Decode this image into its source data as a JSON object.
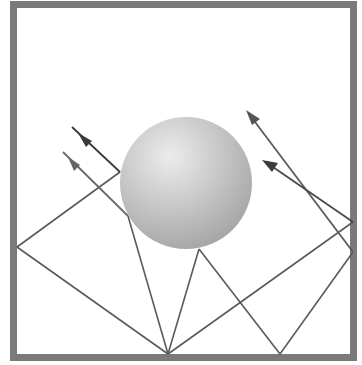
{
  "diagram": {
    "title": "",
    "colors": {
      "frame": "#7a7a7a",
      "ray": "#5a5a5a",
      "arrow_dark": "#3a3a3a",
      "arrow_light": "#6a6a6a",
      "sphere_light": "#ebebeb",
      "sphere_dark": "#a6a6a6",
      "background": "#ffffff"
    },
    "frame": {
      "x": 13.5,
      "y": 4.5,
      "width": 340,
      "height": 353,
      "stroke_width": 7
    },
    "sphere": {
      "cx": 186,
      "cy": 183,
      "r": 66
    },
    "incoming_rays": [
      {
        "name": "incoming-ray-1",
        "from": [
          72,
          127
        ],
        "to": [
          120,
          172
        ]
      },
      {
        "name": "incoming-ray-2",
        "from": [
          63,
          152
        ],
        "to": [
          128,
          216
        ]
      }
    ],
    "reflected_segments": [
      {
        "name": "segment-sphere-to-left-wall",
        "from": [
          120,
          172
        ],
        "to": [
          17,
          247
        ]
      },
      {
        "name": "segment-left-wall-to-bottom",
        "from": [
          17,
          247
        ],
        "to": [
          168,
          354
        ]
      },
      {
        "name": "segment-sphere-to-bottom-1",
        "from": [
          128,
          216
        ],
        "to": [
          168,
          354
        ]
      },
      {
        "name": "segment-bottom-to-sphere",
        "from": [
          168,
          354
        ],
        "to": [
          199,
          249
        ]
      },
      {
        "name": "segment-sphere-to-bottom-2",
        "from": [
          199,
          249
        ],
        "to": [
          280,
          354
        ]
      },
      {
        "name": "segment-bottom-to-right-wall-1",
        "from": [
          168,
          354
        ],
        "to": [
          353,
          222
        ]
      },
      {
        "name": "segment-bottom-to-right-wall-2",
        "from": [
          280,
          354
        ],
        "to": [
          353,
          252
        ]
      }
    ],
    "outgoing_rays": [
      {
        "name": "outgoing-ray-long",
        "from": [
          353,
          252
        ],
        "to": [
          246,
          110
        ]
      },
      {
        "name": "outgoing-ray-short",
        "from": [
          353,
          222
        ],
        "to": [
          263,
          160
        ]
      }
    ]
  }
}
